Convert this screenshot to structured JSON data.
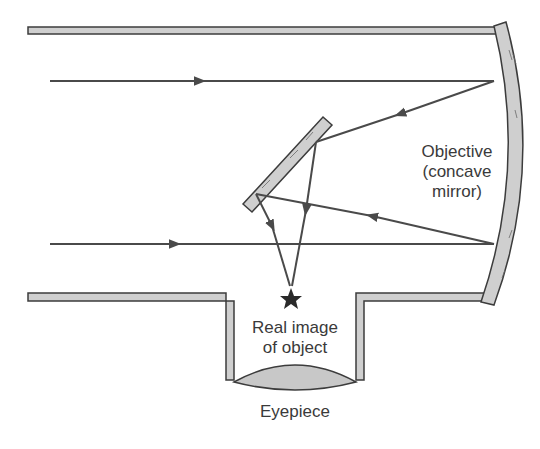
{
  "diagram": {
    "type": "newtonian-reflecting-telescope",
    "labels": {
      "objective_line1": "Objective",
      "objective_line2": "(concave",
      "objective_line3": "mirror)",
      "image_line1": "Real image",
      "image_line2": "of object",
      "eyepiece": "Eyepiece"
    },
    "colors": {
      "outline": "#3c3c3c",
      "fill": "#cfcfcf",
      "ray": "#4a4a4a",
      "text": "#3a3a3a",
      "star": "#2a2a2a"
    },
    "components": [
      "tube",
      "objective-mirror",
      "secondary-flat-mirror",
      "eyepiece-tube",
      "eyepiece-lens",
      "light-rays",
      "real-image-star"
    ]
  }
}
